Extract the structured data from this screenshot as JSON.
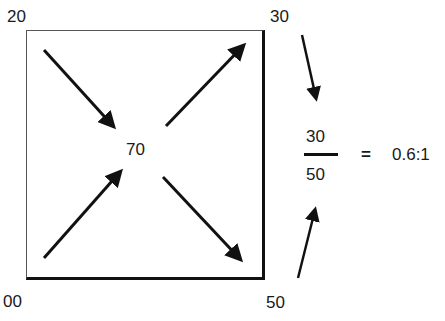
{
  "diagram": {
    "corners": {
      "top_left": "20",
      "top_right": "30",
      "bottom_left": "00",
      "bottom_right": "50"
    },
    "center": "70",
    "fraction": {
      "numerator": "30",
      "denominator": "50"
    },
    "equals": "=",
    "result": "0.6:1",
    "colors": {
      "arrow": "#111111",
      "text": "#1a1a1a",
      "background": "#ffffff"
    }
  }
}
